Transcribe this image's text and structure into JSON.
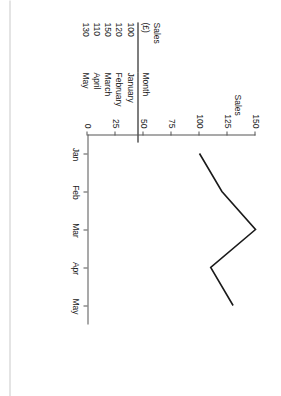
{
  "table": {
    "headers": {
      "sales_line1": "Sales",
      "sales_line2": "(£)",
      "month": "Month"
    },
    "rows": [
      {
        "sales": "100",
        "month": "January"
      },
      {
        "sales": "120",
        "month": "February"
      },
      {
        "sales": "150",
        "month": "March"
      },
      {
        "sales": "110",
        "month": "April"
      },
      {
        "sales": "130",
        "month": "May"
      }
    ]
  },
  "chart_labels": {
    "y_axis_title": "Sales",
    "y_ticks": [
      "0",
      "25",
      "50",
      "75",
      "100",
      "125",
      "150"
    ],
    "x_ticks": [
      "Jan",
      "Feb",
      "Mar",
      "Apr",
      "May"
    ]
  },
  "colors": {
    "line": "#1a1a1a",
    "axis": "#555555",
    "text": "#1a1a1a",
    "page_edge": "#c9c9c9",
    "background": "#ffffff"
  },
  "chart_data": {
    "type": "line",
    "title": "",
    "xlabel": "",
    "ylabel": "Sales",
    "categories": [
      "Jan",
      "Feb",
      "Mar",
      "Apr",
      "May"
    ],
    "values": [
      100,
      120,
      150,
      110,
      130
    ],
    "series": [
      {
        "name": "Sales (£)",
        "values": [
          100,
          120,
          150,
          110,
          130
        ]
      }
    ],
    "ylim": [
      0,
      150
    ],
    "ytick_values": [
      0,
      25,
      50,
      75,
      100,
      125,
      150
    ],
    "grid": false,
    "legend": "none",
    "markers": false,
    "orientation": "page-rotated-90"
  }
}
